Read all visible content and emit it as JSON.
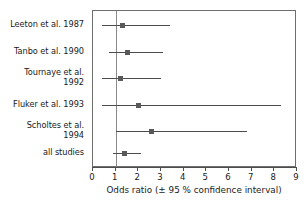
{
  "chart_data": {
    "type": "scatter",
    "subtype": "forest-plot",
    "title": "",
    "xlabel": "Odds ratio (± 95 % confidence interval)",
    "ylabel": "",
    "xlim": [
      0,
      9
    ],
    "xticks": [
      0,
      1,
      2,
      3,
      4,
      5,
      6,
      7,
      8,
      9
    ],
    "xtick_labels": [
      "0",
      "1",
      "2",
      "3",
      "4",
      "5",
      "6",
      "7",
      "8",
      "9"
    ],
    "grid": false,
    "legend": "none",
    "reference_line": 1,
    "categories": [
      "Leeton et al. 1987",
      "Tanbo et al. 1990",
      "Tournaye et al.\n1992",
      "Fluker et al. 1993",
      "Scholtes et al.\n1994",
      "all studies"
    ],
    "series": [
      {
        "name": "Odds ratio",
        "points": [
          {
            "label": "Leeton et al. 1987",
            "estimate": 1.3,
            "ci_low": 0.4,
            "ci_high": 3.4
          },
          {
            "label": "Tanbo et al. 1990",
            "estimate": 1.5,
            "ci_low": 0.7,
            "ci_high": 3.1
          },
          {
            "label": "Tournaye et al. 1992",
            "estimate": 1.2,
            "ci_low": 0.4,
            "ci_high": 3.0
          },
          {
            "label": "Fluker et al. 1993",
            "estimate": 2.0,
            "ci_low": 0.4,
            "ci_high": 8.3
          },
          {
            "label": "Scholtes et al. 1994",
            "estimate": 2.6,
            "ci_low": 1.0,
            "ci_high": 6.8
          },
          {
            "label": "all studies",
            "estimate": 1.4,
            "ci_low": 0.9,
            "ci_high": 2.1
          }
        ]
      }
    ],
    "colors": {
      "marker": "#595959",
      "line": "#4d4d4d",
      "frame": "#6e6e6e",
      "reference": "#8a8a8a",
      "text": "#1a1a1a",
      "background": "#ffffff"
    }
  },
  "rows": [
    {
      "label": "Leeton et al. 1987",
      "estimate": 1.3,
      "ci_low": 0.4,
      "ci_high": 3.4,
      "y": 14
    },
    {
      "label": "Tanbo et al. 1990",
      "estimate": 1.5,
      "ci_low": 0.7,
      "ci_high": 3.1,
      "y": 41
    },
    {
      "label": "Tournaye et al.\n1992",
      "estimate": 1.2,
      "ci_low": 0.4,
      "ci_high": 3.0,
      "y": 67
    },
    {
      "label": "Fluker et al. 1993",
      "estimate": 2.0,
      "ci_low": 0.4,
      "ci_high": 8.3,
      "y": 94
    },
    {
      "label": "Scholtes et al.\n1994",
      "estimate": 2.6,
      "ci_low": 1.0,
      "ci_high": 6.8,
      "y": 120
    },
    {
      "label": "all studies",
      "estimate": 1.4,
      "ci_low": 0.9,
      "ci_high": 2.1,
      "y": 142
    }
  ],
  "axis": {
    "title": "Odds ratio (± 95 % confidence interval)",
    "ticks": [
      "0",
      "1",
      "2",
      "3",
      "4",
      "5",
      "6",
      "7",
      "8",
      "9"
    ]
  }
}
